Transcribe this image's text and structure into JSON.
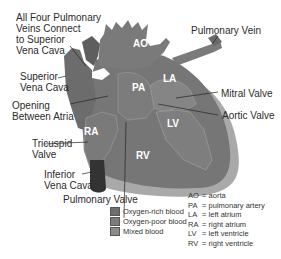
{
  "colors": {
    "oxygen_rich": "#8a8a8a",
    "oxygen_poor": "#6b6b6b",
    "mixed": "#7a7a7a",
    "outer_wall": "#a8a8a8",
    "vena_cava_dark": "#3a3a3a"
  },
  "labels": {
    "pulmonary_veins_connect": [
      "All Four Pulmonary",
      "Veins Connect",
      "to Superior",
      "Vena Cava"
    ],
    "superior_vena_cava": [
      "Superior",
      "Vena Cava"
    ],
    "opening_between_atria": [
      "Opening",
      "Between Atria"
    ],
    "tricuspid_valve": [
      "Tricuspid",
      "Valve"
    ],
    "inferior_vena_cava": [
      "Inferior",
      "Vena Cava"
    ],
    "pulmonary_valve": "Pulmonary Valve",
    "pulmonary_vein": "Pulmonary Vein",
    "mitral_valve": "Mitral Valve",
    "aortic_valve": "Aortic Valve"
  },
  "chambers": {
    "ao": "AO",
    "pa": "PA",
    "la": "LA",
    "ra": "RA",
    "lv": "LV",
    "rv": "RV"
  },
  "legend": [
    {
      "label": "Oxygen-rich blood",
      "color": "#6e6e6e"
    },
    {
      "label": "Oxygen-poor blood",
      "color": "#7c7c7c"
    },
    {
      "label": "Mixed blood",
      "color": "#8c8c8c"
    }
  ],
  "abbreviations": [
    {
      "key": "AO",
      "value": "= aorta"
    },
    {
      "key": "PA",
      "value": "= pulmonary artery"
    },
    {
      "key": "LA",
      "value": "= left atrium"
    },
    {
      "key": "RA",
      "value": "= right atrium"
    },
    {
      "key": "LV",
      "value": "= left ventricle"
    },
    {
      "key": "RV",
      "value": "= right ventricle"
    }
  ]
}
